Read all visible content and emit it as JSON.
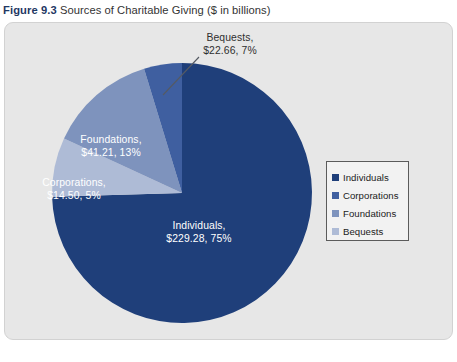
{
  "caption": {
    "figure_number": "Figure 9.3",
    "title": "Sources of Charitable Giving ($ in billions)"
  },
  "legend": {
    "items": [
      {
        "label": "Individuals",
        "color": "#1f3f7a"
      },
      {
        "label": "Corporations",
        "color": "#3f5fa0"
      },
      {
        "label": "Foundations",
        "color": "#7e93bd"
      },
      {
        "label": "Bequests",
        "color": "#aebbd6"
      }
    ]
  },
  "labels": {
    "individuals": "Individuals,\n$229.28, 75%",
    "foundations": "Foundations,\n$41.21, 13%",
    "corporations": "Corporations,\n$14.50, 5%",
    "bequests": "Bequests,\n$22.66, 7%"
  },
  "source_strip": "",
  "chart_data": {
    "type": "pie",
    "title": "Sources of Charitable Giving ($ in billions)",
    "unit": "$ in billions",
    "start_angle_deg": 0,
    "direction": "clockwise",
    "legend_position": "right",
    "grid": false,
    "categories": [
      "Individuals",
      "Corporations",
      "Foundations",
      "Bequests"
    ],
    "values": [
      229.28,
      14.5,
      41.21,
      22.66
    ],
    "percents": [
      75,
      5,
      13,
      7
    ],
    "colors": [
      "#1f3f7a",
      "#3f5fa0",
      "#7e93bd",
      "#aebbd6"
    ],
    "slice_order_clockwise_from_top": [
      "Individuals",
      "Bequests",
      "Foundations",
      "Corporations"
    ],
    "data_labels": [
      {
        "name": "Individuals",
        "text": "Individuals, $229.28, 75%",
        "placement": "inside"
      },
      {
        "name": "Corporations",
        "text": "Corporations, $14.50, 5%",
        "placement": "inside"
      },
      {
        "name": "Foundations",
        "text": "Foundations, $41.21, 13%",
        "placement": "inside"
      },
      {
        "name": "Bequests",
        "text": "Bequests, $22.66, 7%",
        "placement": "outside-leader"
      }
    ]
  },
  "geometry": {
    "center_x": 182,
    "center_y": 193,
    "radius": 130
  }
}
